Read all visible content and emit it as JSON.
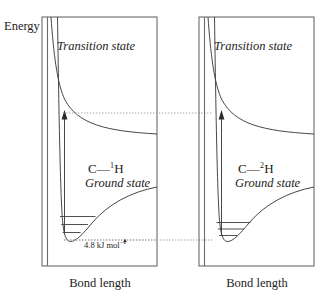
{
  "figure": {
    "axis": {
      "y_label": "Energy",
      "x_label_left": "Bond length",
      "x_label_right": "Bond length"
    },
    "panels": [
      {
        "id": "left",
        "transition_state_label": "Transition state",
        "species": "C—",
        "isotope_mass": "1",
        "isotope_element": "H",
        "ground_state_label": "Ground state",
        "vibrational_levels": 3,
        "zero_point_energy_label": "4.8 kJ mol",
        "zero_point_energy_exponent": "−1"
      },
      {
        "id": "right",
        "transition_state_label": "Transition state",
        "species": "C—",
        "isotope_mass": "2",
        "isotope_element": "H",
        "ground_state_label": "Ground state",
        "vibrational_levels": 3,
        "zero_point_energy_label": "",
        "zero_point_energy_exponent": ""
      }
    ],
    "colors": {
      "frame": "#6b6b6b",
      "curve": "#3d3d3d",
      "dotted": "#9a9a9a",
      "text": "#1c1c1c",
      "background": "#ffffff"
    }
  }
}
